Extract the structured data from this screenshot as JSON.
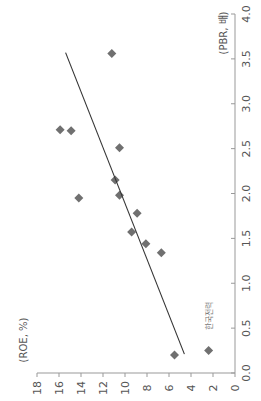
{
  "chart_data": {
    "type": "scatter",
    "title": "",
    "orientation": "rotated-90-ccw",
    "xlabel": "(ROE, %)",
    "ylabel": "(PBR, 배)",
    "xlim": [
      0,
      18
    ],
    "ylim": [
      0.0,
      4.0
    ],
    "x_ticks": [
      "0",
      "2",
      "4",
      "6",
      "8",
      "10",
      "12",
      "14",
      "16",
      "18"
    ],
    "y_ticks": [
      "0.0",
      "0.5",
      "1.0",
      "1.5",
      "2.0",
      "2.5",
      "3.0",
      "3.5",
      "4.0"
    ],
    "grid": false,
    "legend": null,
    "series": [
      {
        "name": "companies",
        "marker": "diamond",
        "color": "#707070",
        "points": [
          {
            "roe": 15.9,
            "pbr": 2.71
          },
          {
            "roe": 14.9,
            "pbr": 2.7
          },
          {
            "roe": 10.5,
            "pbr": 2.51
          },
          {
            "roe": 10.9,
            "pbr": 2.15
          },
          {
            "roe": 10.5,
            "pbr": 1.98
          },
          {
            "roe": 14.2,
            "pbr": 1.95
          },
          {
            "roe": 8.9,
            "pbr": 1.78
          },
          {
            "roe": 9.4,
            "pbr": 1.57
          },
          {
            "roe": 8.1,
            "pbr": 1.44
          },
          {
            "roe": 6.7,
            "pbr": 1.34
          },
          {
            "roe": 11.2,
            "pbr": 3.56
          },
          {
            "roe": 5.5,
            "pbr": 0.2
          },
          {
            "roe": 2.4,
            "pbr": 0.25,
            "label": "한국전력"
          }
        ]
      }
    ],
    "trendline": {
      "type": "linear",
      "color": "#333333",
      "start": {
        "roe": 4.6,
        "pbr": 0.21
      },
      "end": {
        "roe": 15.4,
        "pbr": 3.57
      }
    },
    "annotations": [
      {
        "text": "한국전력",
        "roe": 2.4,
        "pbr": 0.6
      }
    ]
  }
}
